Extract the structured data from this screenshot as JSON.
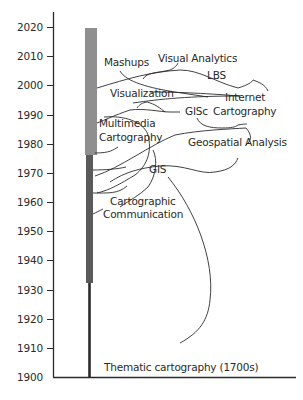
{
  "diagram": {
    "type": "timeline",
    "axis": {
      "ticks": [
        "2020",
        "2010",
        "2000",
        "1990",
        "1980",
        "1970",
        "1960",
        "1950",
        "1940",
        "1930",
        "1920",
        "1910",
        "1900"
      ]
    },
    "bar": {
      "segments": [
        {
          "name": "thin-line",
          "from": 1900,
          "to": 1932,
          "color": "#2b2b2b"
        },
        {
          "name": "dark-segment",
          "from": 1932,
          "to": 1976,
          "color": "#5a5a5a"
        },
        {
          "name": "light-segment",
          "from": 1976,
          "to": 2020,
          "color": "#8f8f8f"
        }
      ]
    },
    "terms": {
      "mashups": "Mashups",
      "visual_analytics": "Visual Analytics",
      "lbs": "LBS",
      "visualization": "Visualization",
      "internet_cartography_1": "Internet",
      "internet_cartography_2": "Cartography",
      "gisc": "GISc",
      "multimedia_1": "Multimedia",
      "multimedia_2": "Cartography",
      "geospatial_analysis": "Geospatial Analysis",
      "gis": "GIS",
      "cartographic_comm_1": "Cartographic",
      "cartographic_comm_2": "Communication",
      "thematic": "Thematic cartography (1700s)"
    }
  }
}
